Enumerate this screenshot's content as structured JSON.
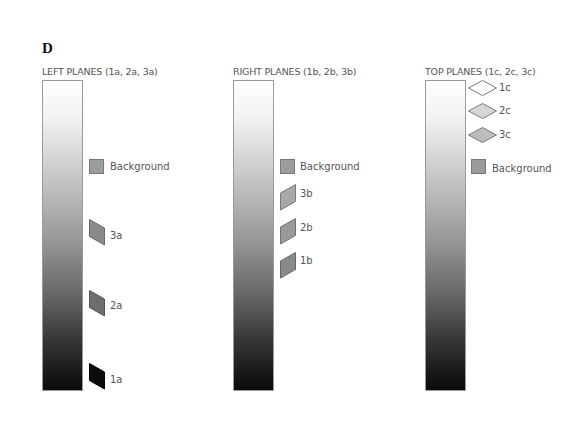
{
  "panel_label": "D",
  "columns": [
    {
      "title": "LEFT PLANES (1a, 2a, 3a)",
      "bar": "gradient-white-to-black",
      "markers": [
        {
          "label": "Background",
          "shape": "square",
          "fill": "#9c9c9c"
        },
        {
          "label": "3a",
          "shape": "parallelogram-left",
          "fill": "#8a8a8a"
        },
        {
          "label": "2a",
          "shape": "parallelogram-left",
          "fill": "#6e6e6e"
        },
        {
          "label": "1a",
          "shape": "parallelogram-left",
          "fill": "#0c0c0c"
        }
      ]
    },
    {
      "title": "RIGHT PLANES (1b, 2b, 3b)",
      "bar": "gradient-white-to-black",
      "markers": [
        {
          "label": "Background",
          "shape": "square",
          "fill": "#9c9c9c"
        },
        {
          "label": "3b",
          "shape": "parallelogram-right",
          "fill": "#a8a8a8"
        },
        {
          "label": "2b",
          "shape": "parallelogram-right",
          "fill": "#999999"
        },
        {
          "label": "1b",
          "shape": "parallelogram-right",
          "fill": "#8a8a8a"
        }
      ]
    },
    {
      "title": "TOP PLANES (1c, 2c, 3c)",
      "bar": "gradient-white-to-black",
      "markers": [
        {
          "label": "1c",
          "shape": "diamond",
          "fill": "#ffffff"
        },
        {
          "label": "2c",
          "shape": "diamond",
          "fill": "#d6d6d6"
        },
        {
          "label": "3c",
          "shape": "diamond",
          "fill": "#bdbdbd"
        },
        {
          "label": "Background",
          "shape": "square",
          "fill": "#9c9c9c"
        }
      ]
    }
  ]
}
